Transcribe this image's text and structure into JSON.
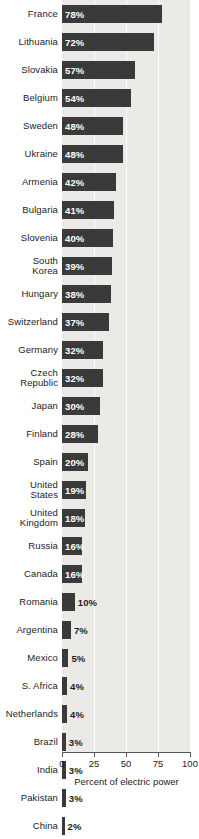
{
  "chart_data": {
    "type": "bar",
    "title": "",
    "xlabel": "Percent of electric power",
    "ylabel": "",
    "xlim": [
      0,
      100
    ],
    "xticks": [
      0,
      25,
      50,
      75,
      100
    ],
    "xtick_labels": [
      "0",
      "25",
      "50",
      "75",
      "100"
    ],
    "orientation": "horizontal",
    "grid": true,
    "legend": "none",
    "value_suffix": "%",
    "bar_color": "#3a3a3a",
    "plot_background": "#eceae7",
    "gridline_color": "#ffffff",
    "inside_label_color": "#ffffff",
    "outside_label_color": "#1d1d1d",
    "categories": [
      "France",
      "Lithuania",
      "Slovakia",
      "Belgium",
      "Sweden",
      "Ukraine",
      "Armenia",
      "Bulgaria",
      "Slovenia",
      "South Korea",
      "Hungary",
      "Switzerland",
      "Germany",
      "Czech Republic",
      "Japan",
      "Finland",
      "Spain",
      "United States",
      "United Kingdom",
      "Russia",
      "Canada",
      "Romania",
      "Argentina",
      "Mexico",
      "S. Africa",
      "Netherlands",
      "Brazil",
      "India",
      "Pakistan",
      "China"
    ],
    "values": [
      78,
      72,
      57,
      54,
      48,
      48,
      42,
      41,
      40,
      39,
      38,
      37,
      32,
      32,
      30,
      28,
      20,
      19,
      18,
      16,
      16,
      10,
      7,
      5,
      4,
      4,
      3,
      3,
      3,
      2
    ],
    "bars": [
      {
        "label_lines": [
          "France"
        ],
        "value": 78,
        "value_text": "78%",
        "label_position": "inside"
      },
      {
        "label_lines": [
          "Lithuania"
        ],
        "value": 72,
        "value_text": "72%",
        "label_position": "inside"
      },
      {
        "label_lines": [
          "Slovakia"
        ],
        "value": 57,
        "value_text": "57%",
        "label_position": "inside"
      },
      {
        "label_lines": [
          "Belgium"
        ],
        "value": 54,
        "value_text": "54%",
        "label_position": "inside"
      },
      {
        "label_lines": [
          "Sweden"
        ],
        "value": 48,
        "value_text": "48%",
        "label_position": "inside"
      },
      {
        "label_lines": [
          "Ukraine"
        ],
        "value": 48,
        "value_text": "48%",
        "label_position": "inside"
      },
      {
        "label_lines": [
          "Armenia"
        ],
        "value": 42,
        "value_text": "42%",
        "label_position": "inside"
      },
      {
        "label_lines": [
          "Bulgaria"
        ],
        "value": 41,
        "value_text": "41%",
        "label_position": "inside"
      },
      {
        "label_lines": [
          "Slovenia"
        ],
        "value": 40,
        "value_text": "40%",
        "label_position": "inside"
      },
      {
        "label_lines": [
          "South",
          "Korea"
        ],
        "value": 39,
        "value_text": "39%",
        "label_position": "inside"
      },
      {
        "label_lines": [
          "Hungary"
        ],
        "value": 38,
        "value_text": "38%",
        "label_position": "inside"
      },
      {
        "label_lines": [
          "Switzerland"
        ],
        "value": 37,
        "value_text": "37%",
        "label_position": "inside"
      },
      {
        "label_lines": [
          "Germany"
        ],
        "value": 32,
        "value_text": "32%",
        "label_position": "inside"
      },
      {
        "label_lines": [
          "Czech",
          "Republic"
        ],
        "value": 32,
        "value_text": "32%",
        "label_position": "inside"
      },
      {
        "label_lines": [
          "Japan"
        ],
        "value": 30,
        "value_text": "30%",
        "label_position": "inside"
      },
      {
        "label_lines": [
          "Finland"
        ],
        "value": 28,
        "value_text": "28%",
        "label_position": "inside"
      },
      {
        "label_lines": [
          "Spain"
        ],
        "value": 20,
        "value_text": "20%",
        "label_position": "inside"
      },
      {
        "label_lines": [
          "United",
          "States"
        ],
        "value": 19,
        "value_text": "19%",
        "label_position": "inside"
      },
      {
        "label_lines": [
          "United",
          "Kingdom"
        ],
        "value": 18,
        "value_text": "18%",
        "label_position": "inside"
      },
      {
        "label_lines": [
          "Russia"
        ],
        "value": 16,
        "value_text": "16%",
        "label_position": "inside"
      },
      {
        "label_lines": [
          "Canada"
        ],
        "value": 16,
        "value_text": "16%",
        "label_position": "inside"
      },
      {
        "label_lines": [
          "Romania"
        ],
        "value": 10,
        "value_text": "10%",
        "label_position": "outside"
      },
      {
        "label_lines": [
          "Argentina"
        ],
        "value": 7,
        "value_text": "7%",
        "label_position": "outside"
      },
      {
        "label_lines": [
          "Mexico"
        ],
        "value": 5,
        "value_text": "5%",
        "label_position": "outside"
      },
      {
        "label_lines": [
          "S. Africa"
        ],
        "value": 4,
        "value_text": "4%",
        "label_position": "outside"
      },
      {
        "label_lines": [
          "Netherlands"
        ],
        "value": 4,
        "value_text": "4%",
        "label_position": "outside"
      },
      {
        "label_lines": [
          "Brazil"
        ],
        "value": 3,
        "value_text": "3%",
        "label_position": "outside"
      },
      {
        "label_lines": [
          "India"
        ],
        "value": 3,
        "value_text": "3%",
        "label_position": "outside"
      },
      {
        "label_lines": [
          "Pakistan"
        ],
        "value": 3,
        "value_text": "3%",
        "label_position": "outside"
      },
      {
        "label_lines": [
          "China"
        ],
        "value": 2,
        "value_text": "2%",
        "label_position": "outside"
      }
    ]
  }
}
